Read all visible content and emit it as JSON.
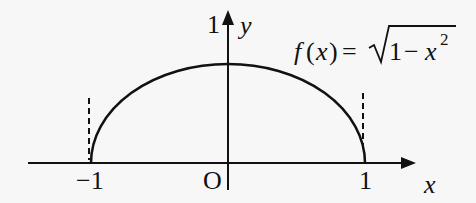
{
  "diagram": {
    "type": "function-graph",
    "function_label": {
      "f": "f",
      "open": "(",
      "var": "x",
      "close": ")",
      "equals": "=",
      "radical_one": "1",
      "minus": "−",
      "rad_var": "x",
      "exponent": "2"
    },
    "axes": {
      "x_label": "x",
      "y_label": "y",
      "origin_label": "O"
    },
    "ticks": {
      "x_neg": "−1",
      "x_pos": "1",
      "y_top": "1"
    },
    "colors": {
      "stroke": "#111111",
      "background": "#f7f7f7"
    }
  }
}
